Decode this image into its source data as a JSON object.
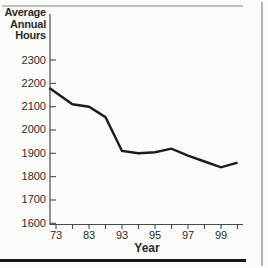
{
  "colors": {
    "background": "#fbfbf9",
    "line": "#1c1c1c",
    "axis": "#4a4a4a",
    "text": "#2b2b2b",
    "frame_top_right": "#b5b5b5",
    "frame_bottom": "#161616"
  },
  "chart_data": {
    "type": "line",
    "title": "Average Annual Hours",
    "ylabel_lines": [
      "Average",
      "Annual",
      "Hours"
    ],
    "xlabel": "Year",
    "x_tick_labels": [
      "73",
      "83",
      "93",
      "95",
      "97",
      "99"
    ],
    "x_tick_positions": [
      0,
      1,
      2,
      3,
      4,
      5
    ],
    "x_minor_tick_positions": [
      0.5,
      1.5,
      2.5,
      3.5,
      4.5,
      5.5
    ],
    "x_axis_note": "equal visual spacing: 10-year steps 73-93, then 2-year steps 93-99",
    "y_ticks": [
      2300,
      2200,
      2100,
      2000,
      1900,
      1800,
      1700,
      1600
    ],
    "ylim": [
      1600,
      2300
    ],
    "grid": false,
    "legend": false,
    "series": [
      {
        "name": "average-annual-hours",
        "points": [
          {
            "year": "73",
            "pos": -0.2,
            "value": 2180
          },
          {
            "year": "78",
            "pos": 0.5,
            "value": 2110
          },
          {
            "year": "83",
            "pos": 1,
            "value": 2100
          },
          {
            "year": "88",
            "pos": 1.5,
            "value": 2055
          },
          {
            "year": "93",
            "pos": 2,
            "value": 1910
          },
          {
            "year": "94",
            "pos": 2.5,
            "value": 1900
          },
          {
            "year": "95",
            "pos": 3,
            "value": 1905
          },
          {
            "year": "96",
            "pos": 3.5,
            "value": 1920
          },
          {
            "year": "97",
            "pos": 4,
            "value": 1890
          },
          {
            "year": "98",
            "pos": 4.5,
            "value": 1865
          },
          {
            "year": "99",
            "pos": 5,
            "value": 1840
          },
          {
            "year": "00",
            "pos": 5.5,
            "value": 1860
          }
        ]
      }
    ]
  }
}
